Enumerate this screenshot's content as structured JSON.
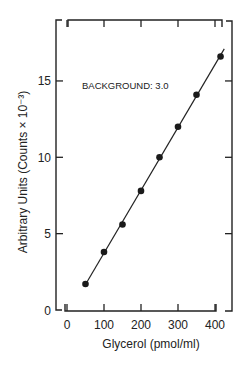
{
  "chart_data": {
    "type": "scatter",
    "title": "",
    "xlabel": "Glycerol (pmol/ml)",
    "ylabel": "Arbitrary  Units (Counts × 10⁻³)",
    "xlim": [
      0,
      430
    ],
    "ylim": [
      0,
      18
    ],
    "x_ticks": [
      0,
      100,
      200,
      300,
      400
    ],
    "y_ticks": [
      0,
      5,
      10,
      15
    ],
    "x_tick_labels": [
      "0",
      "100",
      "200",
      "300",
      "400"
    ],
    "y_tick_labels": [
      "0",
      "5",
      "10",
      "15"
    ],
    "grid": false,
    "legend": null,
    "annotations": [
      "BACKGROUND: 3.0"
    ],
    "series": [
      {
        "name": "measured",
        "marker": "filled-circle",
        "fit_line": "linear",
        "x": [
          50,
          100,
          150,
          200,
          250,
          300,
          350,
          415
        ],
        "y": [
          1.7,
          3.8,
          5.6,
          7.8,
          10.0,
          12.0,
          14.1,
          16.6
        ]
      }
    ]
  }
}
